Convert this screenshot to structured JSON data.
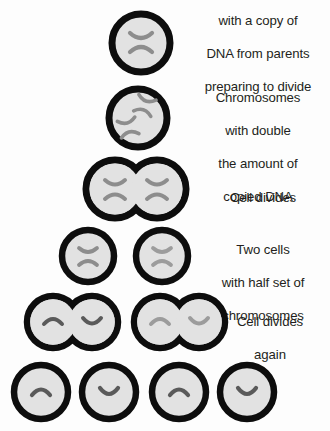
{
  "figure": {
    "title_visible": false,
    "background_color": "#fdfdfd",
    "cell_membrane_color": "#0d0d0d",
    "cytoplasm_color": "#e2e2e2",
    "chromosome_color": "#8d8d8d",
    "chromosome_color_dark": "#5a5a5a",
    "text_color": "#231f20"
  },
  "stages": [
    {
      "id": "stage-1",
      "caption_lines": [
        "with a copy of",
        "DNA from parents",
        "preparing to divide"
      ],
      "cell_count": 1,
      "chromosome_form": "x-shaped",
      "chromosomes_per_cell": 1,
      "note": "top caption line is clipped by the top image edge"
    },
    {
      "id": "stage-2",
      "caption_lines": [
        "Chromosomes",
        "with double",
        "the amount of",
        "copied DNA"
      ],
      "cell_count": 1,
      "chromosome_form": "x-shaped",
      "chromosomes_per_cell": 2
    },
    {
      "id": "stage-3",
      "caption_lines": [
        "Cell divides"
      ],
      "cell_count": 2,
      "cell_arrangement": "fused-dividing",
      "chromosome_form": "x-shaped",
      "chromosomes_per_cell": 1
    },
    {
      "id": "stage-4",
      "caption_lines": [
        "Two cells",
        "with half set of",
        "chromosomes"
      ],
      "cell_count": 2,
      "cell_arrangement": "separate",
      "chromosome_form": "x-shaped",
      "chromosomes_per_cell": 1
    },
    {
      "id": "stage-5",
      "caption_lines": [
        "Cell divides",
        "again"
      ],
      "cell_count": 4,
      "cell_arrangement": "two-fused-pairs",
      "chromosome_form": "half-arc",
      "chromosomes_per_cell": 1
    },
    {
      "id": "stage-6",
      "caption_lines": [],
      "cell_count": 4,
      "cell_arrangement": "separate",
      "chromosome_form": "half-arc",
      "chromosomes_per_cell": 1,
      "note": "caption below this row is clipped by the bottom image edge"
    }
  ]
}
